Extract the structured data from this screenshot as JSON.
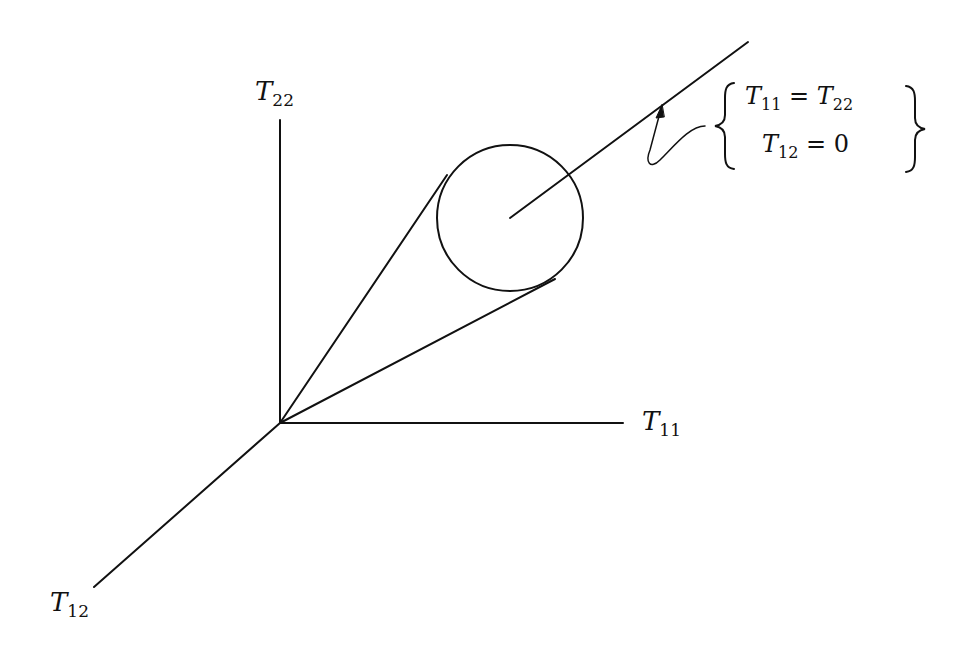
{
  "diagram": {
    "type": "3d-axes-with-cone",
    "axes": {
      "t22": {
        "symbol": "T",
        "sub": "22"
      },
      "t11": {
        "symbol": "T",
        "sub": "11"
      },
      "t12": {
        "symbol": "T",
        "sub": "12"
      }
    },
    "annotation": {
      "line1": {
        "lhs_sym": "T",
        "lhs_sub": "11",
        "op": "=",
        "rhs_sym": "T",
        "rhs_sub": "22"
      },
      "line2": {
        "lhs_sym": "T",
        "lhs_sub": "12",
        "op": "=",
        "rhs": "0"
      }
    },
    "geometry": {
      "origin": [
        280,
        423
      ],
      "circle_center": [
        510,
        218
      ],
      "circle_radius": 73,
      "stroke_color": "#111111"
    }
  }
}
